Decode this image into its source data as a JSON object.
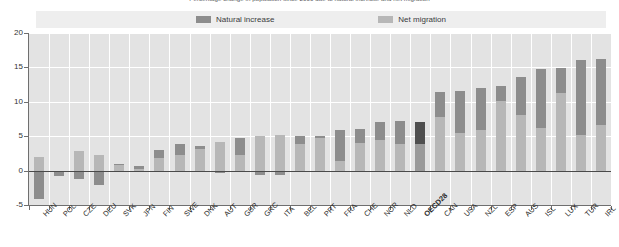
{
  "title": "Percentage change in population since 2000 due to natural increase and net migration",
  "legend": {
    "position": "top-center",
    "entries": [
      {
        "label": "Natural increase",
        "color": "#8d8d8d",
        "key": "natural_increase"
      },
      {
        "label": "Net migration",
        "color": "#b7b7b7",
        "key": "net_migration"
      }
    ]
  },
  "axis": {
    "y_ticks": [
      "20",
      "15",
      "10",
      "5",
      "0",
      "-5"
    ],
    "y_min": -5,
    "y_max": 20
  },
  "highlight_category": "OECD28",
  "chart_data": {
    "type": "bar",
    "stacked": true,
    "title": "Percentage change in population since 2000 due to natural increase and net migration",
    "xlabel": "",
    "ylabel": "",
    "ylim": [
      -5,
      20
    ],
    "grid": true,
    "legend_position": "top-center",
    "categories": [
      "HUN",
      "POL",
      "CZE",
      "DEU",
      "SVK",
      "JPN",
      "FIN",
      "SWE",
      "DNK",
      "AUT",
      "GBR",
      "GRC",
      "ITA",
      "BEL",
      "PRT",
      "FRA",
      "CHE",
      "NOR",
      "NLD",
      "OECD28",
      "CAN",
      "USA",
      "NZL",
      "ESP",
      "AUS",
      "ISL",
      "LUX",
      "TUR",
      "IRL"
    ],
    "series": [
      {
        "name": "Natural increase",
        "color": "#8d8d8d",
        "values": [
          -4.2,
          -0.6,
          -1.2,
          -2.1,
          0.1,
          0.4,
          1.2,
          1.6,
          0.5,
          -0.3,
          2.4,
          -0.7,
          -0.6,
          1.3,
          0.4,
          4.5,
          2.0,
          2.6,
          3.4,
          3.2,
          3.6,
          6.0,
          6.1,
          2.2,
          5.5,
          8.6,
          3.6,
          10.9,
          9.6
        ]
      },
      {
        "name": "Net migration",
        "color": "#b7b7b7",
        "values": [
          2.0,
          -0.2,
          2.8,
          2.3,
          0.8,
          0.2,
          1.8,
          2.2,
          3.1,
          4.2,
          2.3,
          5.1,
          5.2,
          3.8,
          4.7,
          1.4,
          4.0,
          4.4,
          3.8,
          3.9,
          7.8,
          5.5,
          5.9,
          10.1,
          8.1,
          6.2,
          11.3,
          5.2,
          6.6
        ]
      }
    ]
  }
}
